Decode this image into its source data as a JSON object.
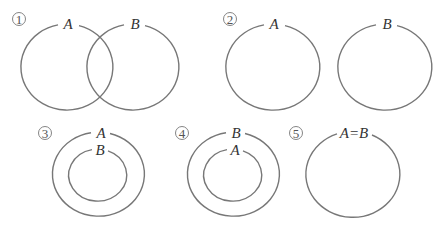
{
  "diagram": {
    "type": "set-relationship Venn diagrams",
    "stroke_color": "#777777",
    "panels": [
      {
        "number": "1",
        "relation": "A and B overlap (partial intersection)",
        "sets": [
          {
            "label": "A",
            "cx": 67,
            "cy": 67,
            "rx": 46,
            "ry": 43
          },
          {
            "label": "B",
            "cx": 133,
            "cy": 67,
            "rx": 46,
            "ry": 43
          }
        ]
      },
      {
        "number": "2",
        "relation": "A and B disjoint",
        "sets": [
          {
            "label": "A",
            "cx": 273,
            "cy": 67,
            "rx": 47,
            "ry": 43
          },
          {
            "label": "B",
            "cx": 385,
            "cy": 67,
            "rx": 47,
            "ry": 43
          }
        ]
      },
      {
        "number": "3",
        "relation": "B is a subset of A",
        "sets": [
          {
            "label": "A",
            "cx": 99,
            "cy": 174,
            "rx": 46,
            "ry": 42
          },
          {
            "label": "B",
            "cx": 99,
            "cy": 175,
            "rx": 29,
            "ry": 26
          }
        ]
      },
      {
        "number": "4",
        "relation": "A is a subset of B",
        "sets": [
          {
            "label": "B",
            "cx": 234,
            "cy": 174,
            "rx": 46,
            "ry": 42
          },
          {
            "label": "A",
            "cx": 234,
            "cy": 175,
            "rx": 29,
            "ry": 26
          }
        ]
      },
      {
        "number": "5",
        "relation": "A equals B",
        "sets": [
          {
            "label": "A=B",
            "cx": 353,
            "cy": 175,
            "rx": 47,
            "ry": 43
          }
        ]
      }
    ]
  },
  "labels": {
    "p1_num": "1",
    "p1_a": "A",
    "p1_b": "B",
    "p2_num": "2",
    "p2_a": "A",
    "p2_b": "B",
    "p3_num": "3",
    "p3_outer": "A",
    "p3_inner": "B",
    "p4_num": "4",
    "p4_outer": "B",
    "p4_inner": "A",
    "p5_num": "5",
    "p5_label": "A=B"
  }
}
